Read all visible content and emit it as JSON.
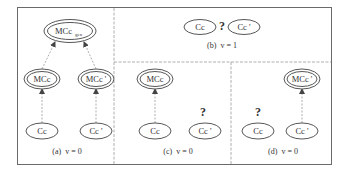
{
  "figure": {
    "panels": [
      {
        "id": "a",
        "caption": "(a)  v = 0",
        "nodes": [
          {
            "id": "mcc_gen",
            "label": "MCc",
            "subscript": "gen",
            "shape": "double-ellipse"
          },
          {
            "id": "mcc",
            "label": "MCc",
            "shape": "double-ellipse"
          },
          {
            "id": "mcc_prime",
            "label": "MCc '",
            "shape": "double-ellipse"
          },
          {
            "id": "cc",
            "label": "Cc",
            "shape": "ellipse"
          },
          {
            "id": "cc_prime",
            "label": "Cc '",
            "shape": "ellipse"
          }
        ],
        "edges": [
          {
            "from": "cc",
            "to": "mcc"
          },
          {
            "from": "cc_prime",
            "to": "mcc_prime"
          },
          {
            "from": "mcc",
            "to": "mcc_gen"
          },
          {
            "from": "mcc_prime",
            "to": "mcc_gen"
          }
        ]
      },
      {
        "id": "b",
        "caption": "(b)  v = 1",
        "nodes": [
          {
            "id": "cc",
            "label": "Cc",
            "shape": "ellipse"
          },
          {
            "id": "cc_prime",
            "label": "Cc '",
            "shape": "ellipse"
          }
        ],
        "question_mark": "?"
      },
      {
        "id": "c",
        "caption": "(c)  v = 0",
        "nodes": [
          {
            "id": "mcc",
            "label": "MCc",
            "shape": "double-ellipse"
          },
          {
            "id": "cc",
            "label": "Cc",
            "shape": "ellipse"
          },
          {
            "id": "cc_prime",
            "label": "Cc '",
            "shape": "ellipse"
          }
        ],
        "edges": [
          {
            "from": "cc",
            "to": "mcc"
          }
        ],
        "question_mark": "?"
      },
      {
        "id": "d",
        "caption": "(d)  v = 0",
        "nodes": [
          {
            "id": "mcc_prime",
            "label": "MCc '",
            "shape": "double-ellipse"
          },
          {
            "id": "cc",
            "label": "Cc",
            "shape": "ellipse"
          },
          {
            "id": "cc_prime",
            "label": "Cc '",
            "shape": "ellipse"
          }
        ],
        "edges": [
          {
            "from": "cc_prime",
            "to": "mcc_prime"
          }
        ],
        "question_mark": "?"
      }
    ]
  }
}
